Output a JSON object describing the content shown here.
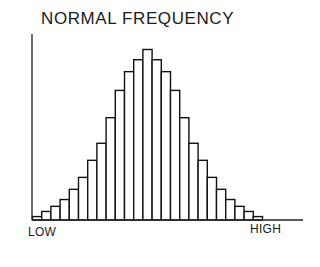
{
  "chart_data": {
    "type": "bar",
    "title": "NORMAL FREQUENCY",
    "xlabel": "",
    "ylabel": "",
    "x_tick_labels": {
      "left": "LOW",
      "right": "HIGH"
    },
    "side_label_fragment": "BUTION",
    "categories": [
      "1",
      "2",
      "3",
      "4",
      "5",
      "6",
      "7",
      "8",
      "9",
      "10",
      "11",
      "12",
      "13",
      "14",
      "15",
      "16",
      "17",
      "18",
      "19",
      "20",
      "21",
      "22",
      "23",
      "24",
      "25"
    ],
    "values": [
      2,
      5,
      8,
      12,
      18,
      25,
      35,
      45,
      60,
      76,
      87,
      94,
      100,
      94,
      87,
      76,
      60,
      45,
      35,
      25,
      18,
      12,
      8,
      5,
      2
    ],
    "ylim": [
      0,
      100
    ],
    "grid": false,
    "legend": null
  },
  "labels": {
    "title": "NORMAL FREQUENCY",
    "low": "LOW",
    "high": "HIGH",
    "side": "BUTION"
  },
  "style": {
    "bar_fill": "#ffffff",
    "bar_stroke": "#111111",
    "axis_color": "#222222"
  }
}
